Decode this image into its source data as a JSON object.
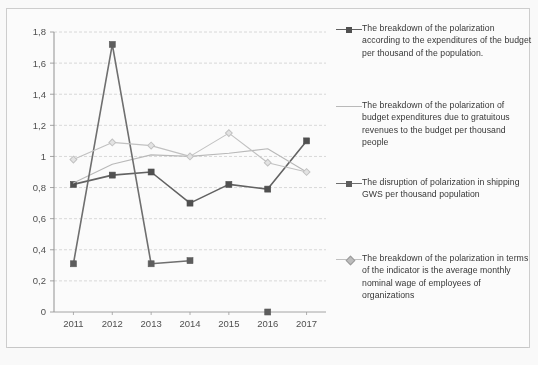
{
  "chart_data": {
    "type": "line",
    "title": "",
    "xlabel": "",
    "ylabel": "",
    "categories": [
      "2011",
      "2012",
      "2013",
      "2014",
      "2015",
      "2016",
      "2017"
    ],
    "x_tick_labels": [
      "2011",
      "2012",
      "2013",
      "2014",
      "2015",
      "2016",
      "2017"
    ],
    "y_tick_labels": [
      "0",
      "0,2",
      "0,4",
      "0,6",
      "0,8",
      "1",
      "1,2",
      "1,4",
      "1,6",
      "1,8"
    ],
    "y_tick_values": [
      0,
      0.2,
      0.4,
      0.6,
      0.8,
      1.0,
      1.2,
      1.4,
      1.6,
      1.8
    ],
    "ylim": [
      0,
      1.8
    ],
    "grid": true,
    "grid_axis": "y",
    "legend_position": "right",
    "series": [
      {
        "name": "The breakdown of the polarization according to the expenditures of the budget per thousand of the population.",
        "marker": "square",
        "color": "#4b4b4b",
        "line_color": "#5e5e5e",
        "values": [
          0.82,
          0.88,
          0.9,
          0.7,
          0.82,
          0.79,
          1.1
        ]
      },
      {
        "name": "The breakdown of the polarization of budget expenditures due to gratuitous revenues to the budget per thousand people",
        "marker": "none",
        "color": "#b9b9b9",
        "line_color": "#b9b9b9",
        "values": [
          0.83,
          0.95,
          1.01,
          1.0,
          1.02,
          1.05,
          0.9
        ]
      },
      {
        "name": "The disruption of polarization in shipping GWS per thousand population",
        "marker": "square",
        "color": "#585858",
        "line_color": "#6b6b6b",
        "values": [
          0.31,
          1.72,
          0.31,
          0.33,
          null,
          0.0,
          null
        ]
      },
      {
        "name": "The breakdown of the polarization in terms of the indicator is the average monthly nominal wage of employees of organizations",
        "marker": "diamond",
        "color": "#c2c2c2",
        "line_color": "#c2c2c2",
        "values": [
          0.98,
          1.09,
          1.07,
          1.0,
          1.15,
          0.96,
          0.9
        ]
      }
    ]
  },
  "legend": {
    "items": [
      {
        "label": "The breakdown of the polarization according to the expenditures of the budget per thousand of the population.",
        "marker": "square"
      },
      {
        "label": "The breakdown of the polarization of budget expenditures due to gratuitous revenues to the budget per thousand people",
        "marker": "line"
      },
      {
        "label": "The disruption of polarization in shipping GWS per thousand population",
        "marker": "square"
      },
      {
        "label": "The breakdown of the polarization in terms of the indicator is the average monthly nominal wage of employees of organizations",
        "marker": "diamond"
      }
    ]
  },
  "colors": {
    "series_dark": "#4b4b4b",
    "series_mid": "#6b6b6b",
    "series_light": "#b9b9b9",
    "series_lighter": "#c2c2c2",
    "grid": "#d0d0d0",
    "axis": "#9a9a9a",
    "text": "#3a3a3a",
    "background": "#ffffff"
  }
}
